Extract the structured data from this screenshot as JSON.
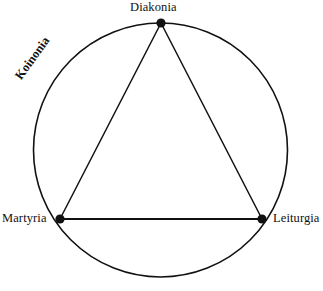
{
  "diagram": {
    "background_color": "#ffffff",
    "stroke_color": "#111111",
    "vertices": [
      {
        "id": "diakonia",
        "label": "Diakonia",
        "x": 161,
        "y": 23,
        "position": "top"
      },
      {
        "id": "martyria",
        "label": "Martyria",
        "x": 60,
        "y": 219,
        "position": "bottom-left"
      },
      {
        "id": "leiturgia",
        "label": "Leiturgia",
        "x": 262,
        "y": 219,
        "position": "bottom-right"
      }
    ],
    "arc_label": {
      "id": "koinonia",
      "label": "Koinonia",
      "rotation_deg": -54,
      "position": "upper-left-arc-exterior"
    },
    "circle": {
      "center_x": 160.5,
      "center_y": 150,
      "radius": 127
    }
  }
}
